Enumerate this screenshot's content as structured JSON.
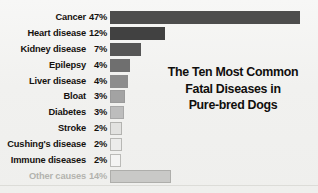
{
  "chart_data": {
    "type": "bar",
    "title": "The Ten Most Common Fatal Diseases in Pure-bred Dogs",
    "title_lines": [
      "The Ten Most Common",
      "Fatal Diseases in",
      "Pure-bred Dogs"
    ],
    "orientation": "horizontal",
    "xlabel": "",
    "ylabel": "",
    "grid": false,
    "legend": "none",
    "value_suffix": "%",
    "categories": [
      "Cancer",
      "Heart disease",
      "Kidney disease",
      "Epilepsy",
      "Liver disease",
      "Bloat",
      "Diabetes",
      "Stroke",
      "Cushing's disease",
      "Immune diseases",
      "Other causes"
    ],
    "values": [
      47,
      12,
      7,
      4,
      4,
      3,
      3,
      2,
      2,
      2,
      14
    ],
    "value_labels": [
      "47%",
      "12%",
      "7%",
      "4%",
      "4%",
      "3%",
      "3%",
      "2%",
      "2%",
      "2%",
      "14%"
    ],
    "bars": [
      {
        "label": "Cancer",
        "value": 47,
        "value_label": "47%",
        "pixel_width": 190,
        "fill": "#4d4d4d",
        "border": "#4d4d4d",
        "muted": false
      },
      {
        "label": "Heart disease",
        "value": 12,
        "value_label": "12%",
        "pixel_width": 55,
        "fill": "#414141",
        "border": "#414141",
        "muted": false
      },
      {
        "label": "Kidney disease",
        "value": 7,
        "value_label": "7%",
        "pixel_width": 31,
        "fill": "#565656",
        "border": "#565656",
        "muted": false
      },
      {
        "label": "Epilepsy",
        "value": 4,
        "value_label": "4%",
        "pixel_width": 20,
        "fill": "#6f6f6f",
        "border": "#6f6f6f",
        "muted": false
      },
      {
        "label": "Liver disease",
        "value": 4,
        "value_label": "4%",
        "pixel_width": 18,
        "fill": "#8c8c8c",
        "border": "#8c8c8c",
        "muted": false
      },
      {
        "label": "Bloat",
        "value": 3,
        "value_label": "3%",
        "pixel_width": 15,
        "fill": "#a3a3a3",
        "border": "#9a9a9a",
        "muted": false
      },
      {
        "label": "Diabetes",
        "value": 3,
        "value_label": "3%",
        "pixel_width": 14,
        "fill": "#bdbdbd",
        "border": "#a8a8a8",
        "muted": false
      },
      {
        "label": "Stroke",
        "value": 2,
        "value_label": "2%",
        "pixel_width": 12,
        "fill": "#e2e2e0",
        "border": "#b3b3b0",
        "muted": false
      },
      {
        "label": "Cushing's disease",
        "value": 2,
        "value_label": "2%",
        "pixel_width": 12,
        "fill": "#ececeb",
        "border": "#b8b8b5",
        "muted": false
      },
      {
        "label": "Immune diseases",
        "value": 2,
        "value_label": "2%",
        "pixel_width": 11,
        "fill": "#f4f4f3",
        "border": "#bbbbb8",
        "muted": false
      },
      {
        "label": "Other causes",
        "value": 14,
        "value_label": "14%",
        "pixel_width": 61,
        "fill": "#c9c9c7",
        "border": "#aeaeab",
        "muted": true
      }
    ],
    "colors": {
      "background": "#f3f3f1",
      "label_text": "#15120f",
      "muted_text": "#b3b3ae",
      "title_text": "#100e0c",
      "rule": "#dcdcd8"
    }
  }
}
